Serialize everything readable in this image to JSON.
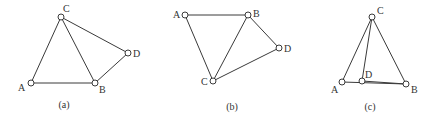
{
  "figures": [
    {
      "caption": "(a)",
      "nodes": [
        {
          "id": "A",
          "label": "A",
          "x": 31,
          "y": 83,
          "lx": 18,
          "ly": 91
        },
        {
          "id": "B",
          "label": "B",
          "x": 95,
          "y": 83,
          "lx": 99,
          "ly": 93
        },
        {
          "id": "C",
          "label": "C",
          "x": 61,
          "y": 17,
          "lx": 63,
          "ly": 12
        },
        {
          "id": "D",
          "label": "D",
          "x": 128,
          "y": 53,
          "lx": 133,
          "ly": 57
        }
      ],
      "edges": [
        [
          "A",
          "B"
        ],
        [
          "A",
          "C"
        ],
        [
          "C",
          "B"
        ],
        [
          "C",
          "D"
        ],
        [
          "B",
          "D"
        ]
      ],
      "caption_pos": {
        "x": 64,
        "y": 108
      }
    },
    {
      "caption": "(b)",
      "nodes": [
        {
          "id": "A",
          "label": "A",
          "x": 185,
          "y": 15,
          "lx": 173,
          "ly": 18
        },
        {
          "id": "B",
          "label": "B",
          "x": 248,
          "y": 15,
          "lx": 253,
          "ly": 17
        },
        {
          "id": "C",
          "label": "C",
          "x": 213,
          "y": 81,
          "lx": 201,
          "ly": 85
        },
        {
          "id": "D",
          "label": "D",
          "x": 279,
          "y": 48,
          "lx": 284,
          "ly": 52
        }
      ],
      "edges": [
        [
          "A",
          "B"
        ],
        [
          "A",
          "C"
        ],
        [
          "B",
          "C"
        ],
        [
          "B",
          "D"
        ],
        [
          "C",
          "D"
        ]
      ],
      "caption_pos": {
        "x": 232,
        "y": 110
      }
    },
    {
      "caption": "(c)",
      "nodes": [
        {
          "id": "A",
          "label": "A",
          "x": 342,
          "y": 82,
          "lx": 331,
          "ly": 93
        },
        {
          "id": "B",
          "label": "B",
          "x": 406,
          "y": 84,
          "lx": 411,
          "ly": 93
        },
        {
          "id": "C",
          "label": "C",
          "x": 372,
          "y": 17,
          "lx": 377,
          "ly": 14
        },
        {
          "id": "D",
          "label": "D",
          "x": 362,
          "y": 81,
          "lx": 365,
          "ly": 78
        }
      ],
      "edges": [
        [
          "A",
          "C"
        ],
        [
          "C",
          "B"
        ],
        [
          "C",
          "D"
        ],
        [
          "A",
          "B"
        ],
        [
          "D",
          "B"
        ]
      ],
      "caption_pos": {
        "x": 370,
        "y": 110
      }
    }
  ]
}
